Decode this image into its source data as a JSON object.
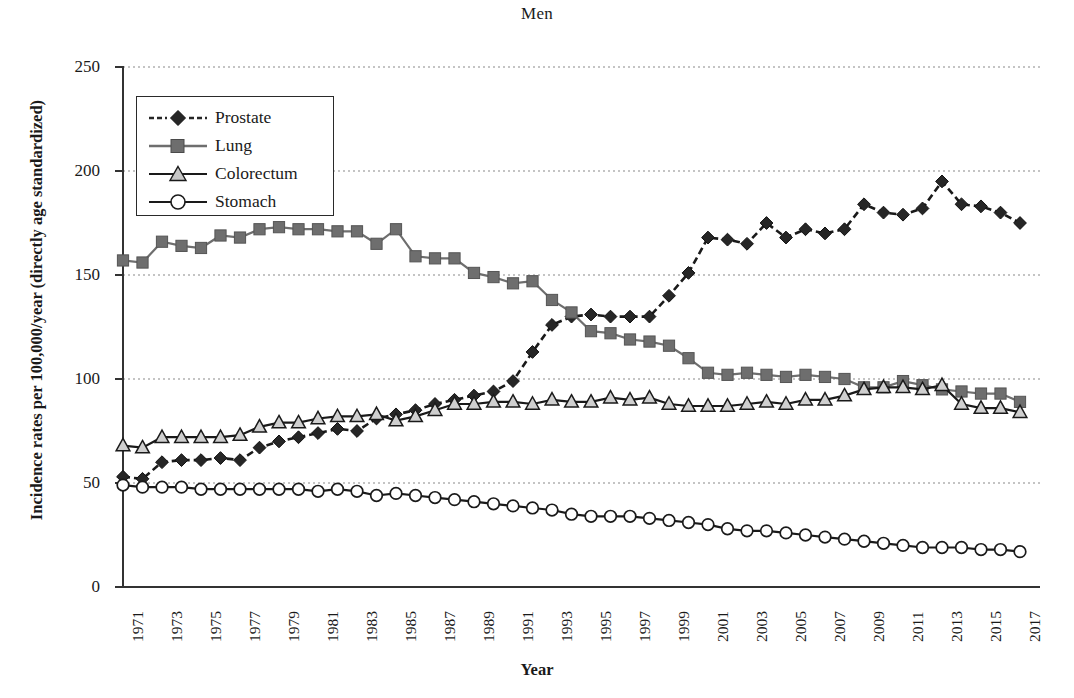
{
  "chart_data": {
    "type": "line",
    "title": "Men",
    "xlabel": "Year",
    "ylabel": "Incidence rates per 100,000/year (directly age standardized)",
    "ylim": [
      0,
      250
    ],
    "yticks": [
      0,
      50,
      100,
      150,
      200,
      250
    ],
    "xlim": [
      1971,
      2017
    ],
    "x": [
      1971,
      1972,
      1973,
      1974,
      1975,
      1976,
      1977,
      1978,
      1979,
      1980,
      1981,
      1982,
      1983,
      1984,
      1985,
      1986,
      1987,
      1988,
      1989,
      1990,
      1991,
      1992,
      1993,
      1994,
      1995,
      1996,
      1997,
      1998,
      1999,
      2000,
      2001,
      2002,
      2003,
      2004,
      2005,
      2006,
      2007,
      2008,
      2009,
      2010,
      2011,
      2012,
      2013,
      2014,
      2015,
      2016,
      2017
    ],
    "xtick_labels": [
      "1971",
      "1973",
      "1975",
      "1977",
      "1979",
      "1981",
      "1983",
      "1985",
      "1987",
      "1989",
      "1991",
      "1993",
      "1995",
      "1997",
      "1999",
      "2001",
      "2003",
      "2005",
      "2007",
      "2009",
      "2011",
      "2013",
      "2015",
      "2017"
    ],
    "grid": "horizontal-dotted",
    "legend_position": "upper-left-inside",
    "series": [
      {
        "name": "Prostate",
        "marker": "diamond",
        "line": "dashed",
        "color": "#262626",
        "values": [
          53,
          52,
          60,
          61,
          61,
          62,
          61,
          67,
          70,
          72,
          74,
          76,
          75,
          81,
          83,
          85,
          88,
          90,
          92,
          94,
          99,
          113,
          126,
          130,
          131,
          130,
          130,
          130,
          140,
          151,
          168,
          167,
          165,
          175,
          168,
          172,
          170,
          172,
          184,
          180,
          179,
          182,
          195,
          184,
          183,
          180,
          175
        ]
      },
      {
        "name": "Lung",
        "marker": "square",
        "line": "solid",
        "color": "#6e6e6e",
        "values": [
          157,
          156,
          166,
          164,
          163,
          169,
          168,
          172,
          173,
          172,
          172,
          171,
          171,
          165,
          172,
          159,
          158,
          158,
          151,
          149,
          146,
          147,
          138,
          132,
          123,
          122,
          119,
          118,
          116,
          110,
          103,
          102,
          103,
          102,
          101,
          102,
          101,
          100,
          96,
          96,
          99,
          97,
          95,
          94,
          93,
          93,
          89
        ]
      },
      {
        "name": "Colorectum",
        "marker": "triangle",
        "line": "solid",
        "color": "#c7c7c7",
        "values": [
          68,
          67,
          72,
          72,
          72,
          72,
          73,
          77,
          79,
          79,
          81,
          82,
          82,
          83,
          80,
          82,
          85,
          88,
          88,
          89,
          89,
          88,
          90,
          89,
          89,
          91,
          90,
          91,
          88,
          87,
          87,
          87,
          88,
          89,
          88,
          90,
          90,
          92,
          95,
          96,
          96,
          95,
          97,
          88,
          86,
          86,
          84
        ]
      },
      {
        "name": "Stomach",
        "marker": "circle",
        "line": "solid",
        "color": "#ffffff",
        "values": [
          49,
          48,
          48,
          48,
          47,
          47,
          47,
          47,
          47,
          47,
          46,
          47,
          46,
          44,
          45,
          44,
          43,
          42,
          41,
          40,
          39,
          38,
          37,
          35,
          34,
          34,
          34,
          33,
          32,
          31,
          30,
          28,
          27,
          27,
          26,
          25,
          24,
          23,
          22,
          21,
          20,
          19,
          19,
          19,
          18,
          18,
          17
        ]
      }
    ]
  }
}
